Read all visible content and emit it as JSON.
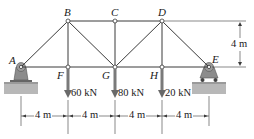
{
  "diagram": {
    "type": "truss",
    "nodes": {
      "A": {
        "label": "A",
        "x": 21,
        "y": 67
      },
      "B": {
        "label": "B",
        "x": 68,
        "y": 21
      },
      "C": {
        "label": "C",
        "x": 115,
        "y": 21
      },
      "D": {
        "label": "D",
        "x": 162,
        "y": 21
      },
      "E": {
        "label": "E",
        "x": 209,
        "y": 67
      },
      "F": {
        "label": "F",
        "x": 68,
        "y": 67
      },
      "G": {
        "label": "G",
        "x": 115,
        "y": 67
      },
      "H": {
        "label": "H",
        "x": 162,
        "y": 67
      }
    },
    "members": [
      [
        "A",
        "B"
      ],
      [
        "B",
        "C"
      ],
      [
        "C",
        "D"
      ],
      [
        "D",
        "E"
      ],
      [
        "A",
        "F"
      ],
      [
        "F",
        "G"
      ],
      [
        "G",
        "H"
      ],
      [
        "H",
        "E"
      ],
      [
        "B",
        "F"
      ],
      [
        "B",
        "G"
      ],
      [
        "C",
        "G"
      ],
      [
        "D",
        "G"
      ],
      [
        "D",
        "H"
      ]
    ],
    "loads": [
      {
        "node": "F",
        "label": "60 kN"
      },
      {
        "node": "G",
        "label": "80 kN"
      },
      {
        "node": "H",
        "label": "20 kN"
      }
    ],
    "supports": [
      {
        "node": "A",
        "type": "pin"
      },
      {
        "node": "E",
        "type": "roller"
      }
    ],
    "dimensions": {
      "horizontal": [
        "4 m",
        "4 m",
        "4 m",
        "4 m"
      ],
      "vertical": "4 m"
    },
    "colors": {
      "member": "#3a3a3a",
      "load_arrow": "#7a7a7a",
      "support": "#8c8c8c",
      "ground": "#b5b5b5"
    }
  }
}
